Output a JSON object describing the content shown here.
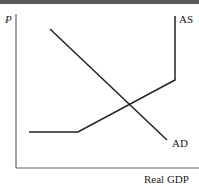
{
  "chart_data": {
    "type": "line",
    "title": "",
    "xlabel": "Real GDP",
    "ylabel": "P",
    "grid": false,
    "legend": "none (curves labeled inline)",
    "series": [
      {
        "name": "AS",
        "label": "AS",
        "description": "Aggregate supply: horizontal, then upward-sloping, then vertical",
        "points_px": [
          [
            29,
            132
          ],
          [
            78,
            132
          ],
          [
            175,
            80
          ],
          [
            175,
            16
          ]
        ],
        "color": "#222222"
      },
      {
        "name": "AD",
        "label": "AD",
        "description": "Aggregate demand: downward-sloping straight line",
        "points_px": [
          [
            50,
            29
          ],
          [
            167,
            140
          ]
        ],
        "color": "#222222"
      }
    ],
    "equilibrium_px": [
      130,
      104
    ],
    "axes": {
      "origin_px": [
        16,
        168
      ],
      "x_end_px": 199,
      "y_top_px": 14,
      "color": "#666666"
    },
    "top_rule_color": "#5a5a5a"
  },
  "labels": {
    "y_axis": "P",
    "x_axis": "Real GDP",
    "as_curve": "AS",
    "ad_curve": "AD"
  }
}
